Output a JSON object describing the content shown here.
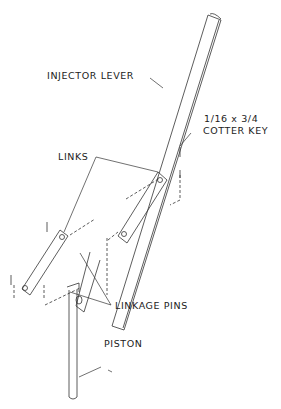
{
  "diagram": {
    "labels": {
      "injector_lever": "INJECTOR LEVER",
      "cotter_key_size": "1/16 x 3/4",
      "cotter_key": "COTTER KEY",
      "links": "LINKS",
      "linkage_pins": "LINKAGE PINS",
      "piston": "PISTON"
    },
    "line_color": "#333333",
    "background": "#ffffff"
  }
}
